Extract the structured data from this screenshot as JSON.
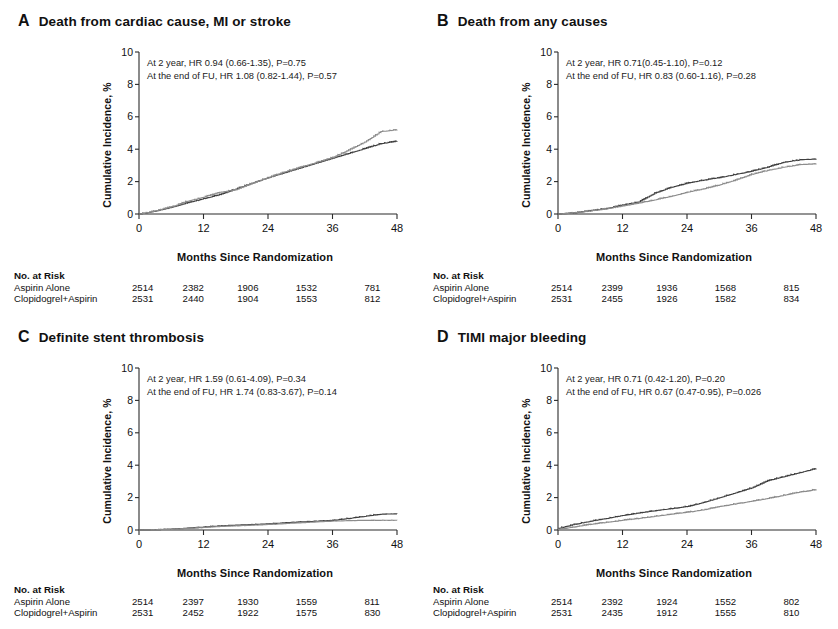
{
  "figure": {
    "axis": {
      "ylabel": "Cumulative Incidence, %",
      "xlabel": "Months Since Randomization",
      "yticks": [
        "0",
        "2",
        "4",
        "6",
        "8",
        "10"
      ],
      "xticks": [
        "0",
        "12",
        "24",
        "36",
        "48"
      ],
      "ylim": [
        0,
        10
      ],
      "xlim": [
        0,
        48
      ]
    },
    "risk_header": "No. at Risk",
    "arm_labels": [
      "Aspirin Alone",
      "Clopidogrel+Aspirin"
    ],
    "colors": {
      "aspirin_alone": "#3f3f3f",
      "clopidogrel_aspirin": "#8c8c8c",
      "axis": "#2b2b2b"
    }
  },
  "panels": [
    {
      "letter": "A",
      "title": "Death from cardiac cause, MI or stroke",
      "annotation": [
        "At 2 year, HR 0.94 (0.66-1.35), P=0.75",
        "At the end of FU, HR 1.08 (0.82-1.44), P=0.57"
      ],
      "risk": {
        "rows": [
          {
            "label": "Aspirin Alone",
            "values": [
              "2514",
              "2382",
              "1906",
              "1532",
              "781"
            ]
          },
          {
            "label": "Clopidogrel+Aspirin",
            "values": [
              "2531",
              "2440",
              "1904",
              "1553",
              "812"
            ]
          }
        ]
      },
      "chart_data": {
        "type": "line",
        "title": "Death from cardiac cause, MI or stroke",
        "xlabel": "Months Since Randomization",
        "ylabel": "Cumulative Incidence, %",
        "xlim": [
          0,
          48
        ],
        "ylim": [
          0,
          10
        ],
        "grid": false,
        "legend": "none",
        "x": [
          0,
          3,
          6,
          9,
          12,
          15,
          18,
          21,
          24,
          27,
          30,
          33,
          36,
          39,
          42,
          45,
          48
        ],
        "series": [
          {
            "name": "Aspirin Alone",
            "values": [
              0,
              0.18,
              0.42,
              0.7,
              0.95,
              1.2,
              1.55,
              1.9,
              2.25,
              2.55,
              2.85,
              3.15,
              3.45,
              3.75,
              4.05,
              4.35,
              4.5
            ]
          },
          {
            "name": "Clopidogrel+Aspirin",
            "values": [
              0,
              0.2,
              0.45,
              0.8,
              1.05,
              1.35,
              1.5,
              1.9,
              2.25,
              2.6,
              2.9,
              3.2,
              3.5,
              3.95,
              4.45,
              5.1,
              5.2
            ]
          }
        ]
      }
    },
    {
      "letter": "B",
      "title": "Death from any causes",
      "annotation": [
        "At 2 year, HR 0.71(0.45-1.10), P=0.12",
        "At the end of FU, HR 0.83 (0.60-1.16), P=0.28"
      ],
      "risk": {
        "rows": [
          {
            "label": "Aspirin Alone",
            "values": [
              "2514",
              "2399",
              "1936",
              "1568",
              "815"
            ]
          },
          {
            "label": "Clopidogrel+Aspirin",
            "values": [
              "2531",
              "2455",
              "1926",
              "1582",
              "834"
            ]
          }
        ]
      },
      "chart_data": {
        "type": "line",
        "title": "Death from any causes",
        "xlabel": "Months Since Randomization",
        "ylabel": "Cumulative Incidence, %",
        "xlim": [
          0,
          48
        ],
        "ylim": [
          0,
          10
        ],
        "grid": false,
        "legend": "none",
        "x": [
          0,
          3,
          6,
          9,
          12,
          15,
          18,
          21,
          24,
          27,
          30,
          33,
          36,
          39,
          42,
          45,
          48
        ],
        "series": [
          {
            "name": "Aspirin Alone",
            "values": [
              0,
              0.08,
              0.2,
              0.35,
              0.55,
              0.75,
              1.3,
              1.65,
              1.9,
              2.1,
              2.25,
              2.45,
              2.65,
              2.9,
              3.2,
              3.35,
              3.4
            ]
          },
          {
            "name": "Clopidogrel+Aspirin",
            "values": [
              0,
              0.08,
              0.2,
              0.32,
              0.5,
              0.68,
              0.88,
              1.1,
              1.35,
              1.55,
              1.8,
              2.1,
              2.45,
              2.7,
              2.9,
              3.05,
              3.1
            ]
          }
        ]
      }
    },
    {
      "letter": "C",
      "title": "Definite stent thrombosis",
      "annotation": [
        "At 2 year, HR 1.59 (0.61-4.09), P=0.34",
        "At the end of FU, HR 1.74 (0.83-3.67), P=0.14"
      ],
      "risk": {
        "rows": [
          {
            "label": "Aspirin Alone",
            "values": [
              "2514",
              "2397",
              "1930",
              "1559",
              "811"
            ]
          },
          {
            "label": "Clopidogrel+Aspirin",
            "values": [
              "2531",
              "2452",
              "1922",
              "1575",
              "830"
            ]
          }
        ]
      },
      "chart_data": {
        "type": "line",
        "title": "Definite stent thrombosis",
        "xlabel": "Months Since Randomization",
        "ylabel": "Cumulative Incidence, %",
        "xlim": [
          0,
          48
        ],
        "ylim": [
          0,
          10
        ],
        "grid": false,
        "legend": "none",
        "x": [
          0,
          3,
          6,
          9,
          12,
          15,
          18,
          21,
          24,
          27,
          30,
          33,
          36,
          39,
          42,
          45,
          48
        ],
        "series": [
          {
            "name": "Aspirin Alone",
            "values": [
              0,
              0.02,
              0.06,
              0.12,
              0.18,
              0.26,
              0.3,
              0.34,
              0.38,
              0.45,
              0.5,
              0.55,
              0.6,
              0.72,
              0.85,
              0.98,
              1.0
            ]
          },
          {
            "name": "Clopidogrel+Aspirin",
            "values": [
              0,
              0.02,
              0.05,
              0.1,
              0.16,
              0.22,
              0.26,
              0.3,
              0.34,
              0.4,
              0.45,
              0.5,
              0.55,
              0.58,
              0.6,
              0.6,
              0.6
            ]
          }
        ]
      }
    },
    {
      "letter": "D",
      "title": "TIMI major bleeding",
      "annotation": [
        "At 2 year, HR 0.71 (0.42-1.20), P=0.20",
        "At the end of FU, HR 0.67 (0.47-0.95), P=0.026"
      ],
      "risk": {
        "rows": [
          {
            "label": "Aspirin Alone",
            "values": [
              "2514",
              "2392",
              "1924",
              "1552",
              "802"
            ]
          },
          {
            "label": "Clopidogrel+Aspirin",
            "values": [
              "2531",
              "2435",
              "1912",
              "1555",
              "810"
            ]
          }
        ]
      },
      "chart_data": {
        "type": "line",
        "title": "TIMI major bleeding",
        "xlabel": "Months Since Randomization",
        "ylabel": "Cumulative Incidence, %",
        "xlim": [
          0,
          48
        ],
        "ylim": [
          0,
          10
        ],
        "grid": false,
        "legend": "none",
        "x": [
          0,
          3,
          6,
          9,
          12,
          15,
          18,
          21,
          24,
          27,
          30,
          33,
          36,
          39,
          42,
          45,
          48
        ],
        "series": [
          {
            "name": "Aspirin Alone",
            "values": [
              0.1,
              0.35,
              0.55,
              0.72,
              0.9,
              1.05,
              1.2,
              1.32,
              1.45,
              1.7,
              2.0,
              2.3,
              2.6,
              3.05,
              3.3,
              3.55,
              3.8
            ]
          },
          {
            "name": "Clopidogrel+Aspirin",
            "values": [
              0.05,
              0.2,
              0.35,
              0.48,
              0.6,
              0.72,
              0.85,
              0.98,
              1.1,
              1.25,
              1.45,
              1.62,
              1.78,
              1.95,
              2.15,
              2.35,
              2.5
            ]
          }
        ]
      }
    }
  ]
}
